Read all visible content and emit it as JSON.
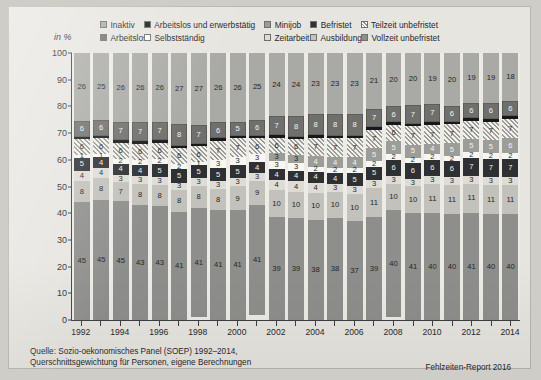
{
  "axis_unit_label": "in %",
  "legend": {
    "row1": [
      {
        "label": "Inaktiv",
        "key": "inaktiv",
        "color": "#a9a9a5"
      },
      {
        "label": "Arbeitslos und erwerbstätig",
        "key": "aue",
        "color": "#19191a"
      },
      {
        "label": "Minijob",
        "key": "minijob",
        "color": "#9a9a98"
      },
      {
        "label": "Befristet",
        "key": "befristet",
        "color": "#2f3134"
      },
      {
        "label": "Teilzeit unbefristet",
        "key": "teilzeit",
        "color": "#8f8f8c"
      }
    ],
    "row2": [
      {
        "label": "Arbeitslos",
        "key": "arbeitslos",
        "color": "#70716f"
      },
      {
        "label": "Selbstständig",
        "key": "selbst",
        "color": "#fbfaf7"
      },
      {
        "label": "Zeitarbeit",
        "key": "zeitarbeit",
        "color": "#dedcd7"
      },
      {
        "label": "Ausbildung",
        "key": "ausbildung",
        "color": "#c3c2bd"
      },
      {
        "label": "Vollzeit unbefristet",
        "key": "vollzeit",
        "color": "#8e8f8c"
      }
    ]
  },
  "source_line1": "Quelle: Sozio-oekonomisches Panel (SOEP) 1992–2014,",
  "source_line2": "Querschnittsgewichtung für Personen, eigene Berechnungen",
  "credit": "Fehlzeiten-Report 2016",
  "chart_data": {
    "type": "bar",
    "stacked": true,
    "stack_total": 100,
    "title": "",
    "xlabel": "",
    "ylabel": "in %",
    "ylim": [
      0,
      100
    ],
    "ytick_step": 10,
    "yticks": [
      0,
      10,
      20,
      30,
      40,
      50,
      60,
      70,
      80,
      90,
      100
    ],
    "grid": false,
    "legend_position": "top",
    "categories": [
      "1992",
      "1993",
      "1994",
      "1995",
      "1996",
      "1997",
      "1998",
      "1999",
      "2000",
      "2001",
      "2002",
      "2003",
      "2004",
      "2005",
      "2006",
      "2007",
      "2008",
      "2009",
      "2010",
      "2011",
      "2012",
      "2013",
      "2014"
    ],
    "xtick_labels": [
      "1992",
      "",
      "1994",
      "",
      "1996",
      "",
      "1998",
      "",
      "2000",
      "",
      "2002",
      "",
      "2004",
      "",
      "2006",
      "",
      "2008",
      "",
      "2010",
      "",
      "2012",
      "",
      "2014"
    ],
    "stack_order_bottom_to_top": [
      "vollzeit",
      "ausbildung",
      "zeitarbeit",
      "befristet",
      "selbst",
      "minijob",
      "teilzeit",
      "aue",
      "arbeitslos",
      "inaktiv"
    ],
    "series": [
      {
        "name": "Vollzeit unbefristet",
        "key": "vollzeit",
        "values": [
          45,
          45,
          45,
          43,
          43,
          41,
          41,
          41,
          41,
          41,
          39,
          39,
          38,
          38,
          37,
          39,
          40,
          41,
          40,
          40,
          41,
          40,
          40
        ]
      },
      {
        "name": "Ausbildung",
        "key": "ausbildung",
        "values": [
          8,
          8,
          7,
          8,
          8,
          8,
          8,
          8,
          9,
          9,
          10,
          10,
          10,
          10,
          10,
          11,
          10,
          10,
          11,
          11,
          11,
          11,
          11
        ]
      },
      {
        "name": "Zeitarbeit",
        "key": "zeitarbeit",
        "values": [
          4,
          4,
          3,
          3,
          3,
          3,
          3,
          3,
          3,
          3,
          4,
          4,
          4,
          3,
          3,
          3,
          3,
          3,
          3,
          3,
          3,
          3,
          3
        ]
      },
      {
        "name": "Befristet",
        "key": "befristet",
        "values": [
          5,
          4,
          4,
          4,
          5,
          5,
          5,
          5,
          5,
          4,
          4,
          4,
          4,
          4,
          5,
          5,
          6,
          6,
          6,
          6,
          7,
          7,
          7
        ]
      },
      {
        "name": "Selbstständig",
        "key": "selbst",
        "values": [
          1,
          1,
          2,
          2,
          2,
          2,
          1,
          3,
          3,
          3,
          3,
          3,
          2,
          2,
          2,
          2,
          2,
          2,
          2,
          2,
          2,
          2,
          2
        ]
      },
      {
        "name": "Minijob",
        "key": "minijob",
        "values": [
          0,
          0,
          0,
          0,
          0,
          0,
          0,
          0,
          0,
          0,
          3,
          3,
          4,
          4,
          4,
          5,
          5,
          5,
          4,
          5,
          5,
          5,
          6
        ]
      },
      {
        "name": "Teilzeit unbefristet",
        "key": "teilzeit",
        "values": [
          6,
          6,
          6,
          6,
          6,
          6,
          6,
          7,
          7,
          6,
          6,
          6,
          7,
          7,
          7,
          7,
          6,
          7,
          7,
          7,
          7,
          7,
          7
        ]
      },
      {
        "name": "Arbeitslos und erwerbstätig",
        "key": "aue",
        "values": [
          1,
          1,
          1,
          1,
          1,
          1,
          1,
          1,
          1,
          1,
          1,
          1,
          1,
          1,
          1,
          1,
          1,
          1,
          1,
          1,
          1,
          1,
          1
        ]
      },
      {
        "name": "Arbeitslos",
        "key": "arbeitslos",
        "values": [
          6,
          6,
          7,
          7,
          7,
          8,
          7,
          6,
          5,
          6,
          7,
          8,
          8,
          8,
          8,
          7,
          6,
          7,
          7,
          6,
          6,
          6,
          6
        ]
      },
      {
        "name": "Inaktiv",
        "key": "inaktiv",
        "values": [
          26,
          25,
          26,
          26,
          26,
          27,
          27,
          26,
          26,
          25,
          24,
          24,
          23,
          23,
          23,
          21,
          20,
          20,
          19,
          20,
          19,
          19,
          18
        ]
      }
    ],
    "label_map": {
      "vollzeit": [
        "45",
        "45",
        "45",
        "43",
        "43",
        "41",
        "41",
        "41",
        "41",
        "41",
        "39",
        "39",
        "38",
        "38",
        "37",
        "39",
        "40",
        "41",
        "40",
        "40",
        "41",
        "40",
        "40"
      ],
      "ausbildung": [
        "8",
        "8",
        "7",
        "8",
        "8",
        "8",
        "8",
        "8",
        "9",
        "9",
        "10",
        "10",
        "10",
        "10",
        "10",
        "11",
        "10",
        "10",
        "11",
        "11",
        "11",
        "11",
        "11"
      ],
      "zeitarbeit": [
        "4",
        "4",
        "3",
        "3",
        "3",
        "3",
        "3",
        "3",
        "3",
        "3",
        "4",
        "4",
        "4",
        "3",
        "3",
        "3",
        "3",
        "3",
        "3",
        "3",
        "3",
        "3",
        "3"
      ],
      "befristet": [
        "5",
        "4",
        "4",
        "4",
        "5",
        "5",
        "5",
        "5",
        "5",
        "4",
        "4",
        "4",
        "4",
        "4",
        "5",
        "5",
        "6",
        "6",
        "6",
        "6",
        "7",
        "7",
        "7"
      ],
      "selbst": [
        "1",
        "1",
        "2",
        "2",
        "2",
        "2",
        "1",
        "3",
        "3",
        "3",
        "3",
        "3",
        "2",
        "2",
        "2",
        "2",
        "2",
        "2",
        "2",
        "2",
        "2",
        "2",
        "2"
      ],
      "minijob": [
        "",
        "",
        "",
        "",
        "",
        "",
        "",
        "",
        "",
        "",
        "3",
        "3",
        "4",
        "4",
        "4",
        "5",
        "5",
        "5",
        "4",
        "5",
        "5",
        "5",
        "6"
      ],
      "teilzeit": [
        "6",
        "6",
        "6",
        "6",
        "6",
        "6",
        "6",
        "7",
        "7",
        "6",
        "6",
        "6",
        "7",
        "7",
        "7",
        "7",
        "6",
        "7",
        "7",
        "7",
        "7",
        "7",
        "7"
      ],
      "aue": [
        "",
        "",
        "",
        "",
        "",
        "",
        "",
        "",
        "",
        "",
        "",
        "",
        "",
        "",
        "",
        "",
        "",
        "",
        "",
        "",
        "",
        "",
        ""
      ],
      "arbeitslos": [
        "6",
        "6",
        "7",
        "7",
        "7",
        "8",
        "7",
        "6",
        "5",
        "6",
        "7",
        "8",
        "8",
        "8",
        "8",
        "7",
        "6",
        "7",
        "7",
        "6",
        "6",
        "6",
        "6"
      ],
      "inaktiv": [
        "26",
        "25",
        "26",
        "26",
        "26",
        "27",
        "27",
        "26",
        "26",
        "25",
        "24",
        "24",
        "23",
        "23",
        "23",
        "21",
        "20",
        "20",
        "19",
        "20",
        "19",
        "19",
        "18"
      ]
    }
  }
}
